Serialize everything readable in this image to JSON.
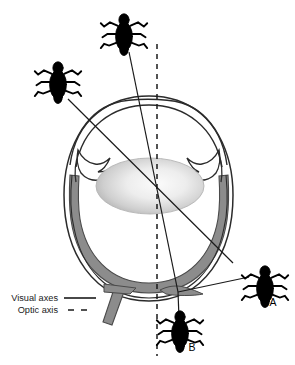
{
  "figure": {
    "kind": "anatomical-diagram",
    "background_color": "#ffffff"
  },
  "legend": {
    "items": [
      {
        "label": "Visual axes",
        "style": "solid",
        "swatch": "solid-line"
      },
      {
        "label": "Optic axis",
        "style": "dashed",
        "swatch": "dashed-line"
      }
    ]
  },
  "point_labels": [
    {
      "id": "A",
      "text": "A"
    },
    {
      "id": "B",
      "text": "B"
    }
  ],
  "objects": [
    {
      "id": "bug-top",
      "name": "bug-top",
      "cx": 124,
      "cy": 36
    },
    {
      "id": "bug-left",
      "name": "bug-left",
      "cx": 60,
      "cy": 85
    },
    {
      "id": "bug-right",
      "name": "bug-right-A",
      "cx": 265,
      "cy": 288,
      "label": "A"
    },
    {
      "id": "bug-bottom",
      "name": "bug-bottom-B",
      "cx": 180,
      "cy": 333,
      "label": "B"
    }
  ],
  "anatomy": {
    "parts": [
      "sclera",
      "cornea",
      "iris",
      "ciliary-body",
      "lens",
      "retina",
      "fovea",
      "optic-nerve"
    ]
  },
  "colors": {
    "outline": "#2b2b2b",
    "retina_fill": "#8c8c8c",
    "retina_stroke": "#4a4a4a",
    "lens_light": "#f2f2f2",
    "lens_dark": "#9a9a9a",
    "bug_fill": "#000000",
    "axis_line": "#1a1a1a",
    "text": "#1a1a1a"
  },
  "geometry": {
    "optic_axis": {
      "x": 157,
      "y_top": 44,
      "y_bottom": 356
    },
    "fovea": {
      "x": 178,
      "y": 292
    },
    "visual_axis_from_top_bug": {
      "x1": 129,
      "y1": 52,
      "x2": 178,
      "y2": 292
    },
    "visual_axis_from_left_bug": {
      "x1": 70,
      "y1": 100,
      "x2": 230,
      "y2": 258
    },
    "visual_axis_from_right_bug": {
      "x1": 247,
      "y1": 278,
      "x2": 178,
      "y2": 292
    }
  }
}
